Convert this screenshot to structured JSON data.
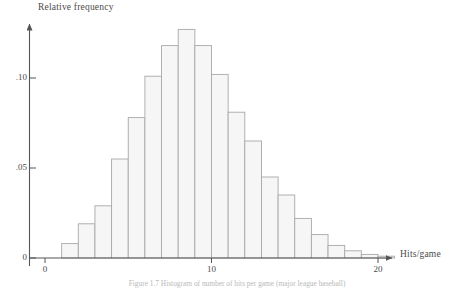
{
  "figure": {
    "caption": "Figure 1.7  Histogram of number of hits per game (major league baseball)"
  },
  "chart_data": {
    "type": "bar",
    "title": "",
    "subtitle": "",
    "xlabel": "Hits/game",
    "ylabel": "Relative frequency",
    "grid": false,
    "legend": "none",
    "bar_style": "histogram",
    "bin_width": 1,
    "xlim": [
      0,
      22
    ],
    "ylim": [
      0,
      0.135
    ],
    "xticks": [
      0,
      10,
      20
    ],
    "xtick_labels": [
      "0",
      "10",
      "20"
    ],
    "yticks": [
      0,
      0.05,
      0.1
    ],
    "ytick_labels": [
      "0",
      ".05",
      ".10"
    ],
    "bin_starts": [
      0,
      1,
      2,
      3,
      4,
      5,
      6,
      7,
      8,
      9,
      10,
      11,
      12,
      13,
      14,
      15,
      16,
      17,
      18,
      19,
      20,
      21
    ],
    "categories": [
      "0-1",
      "1-2",
      "2-3",
      "3-4",
      "4-5",
      "5-6",
      "6-7",
      "7-8",
      "8-9",
      "9-10",
      "10-11",
      "11-12",
      "12-13",
      "13-14",
      "14-15",
      "15-16",
      "16-17",
      "17-18",
      "18-19",
      "19-20",
      "20-21",
      "21-22"
    ],
    "values": [
      0.0,
      0.008,
      0.019,
      0.029,
      0.055,
      0.078,
      0.101,
      0.118,
      0.127,
      0.118,
      0.102,
      0.081,
      0.065,
      0.045,
      0.035,
      0.022,
      0.013,
      0.007,
      0.004,
      0.002,
      0.001,
      0.0
    ]
  },
  "colors": {
    "axis": "#555555",
    "bar_fill": "#f6f6f6",
    "bar_stroke": "#a8a8a8",
    "text": "#4a4a4a"
  }
}
